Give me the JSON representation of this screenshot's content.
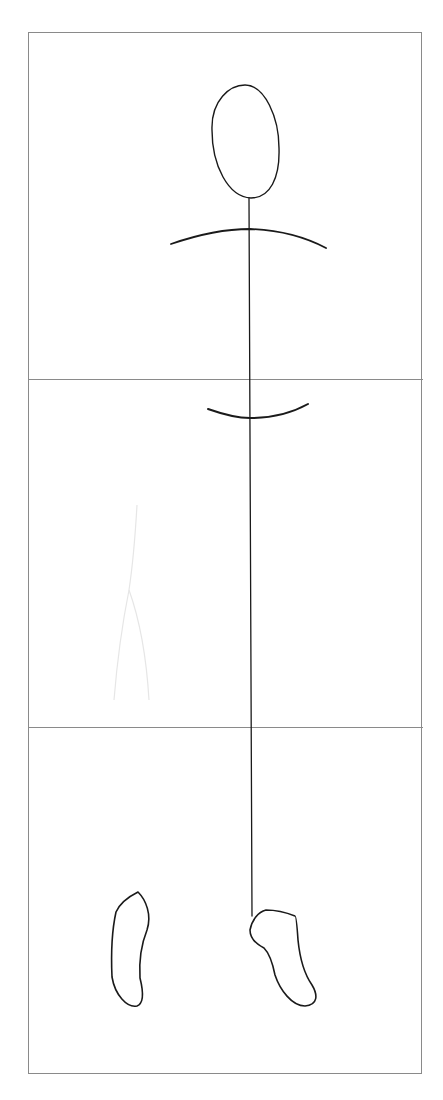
{
  "drawing": {
    "subject": "stick figure proportion sketch",
    "paper_color": "#ffffff",
    "frame_color": "#8a8a8a",
    "ink_color": "#1a1a1a",
    "ghost_color": "#e4e4e4",
    "sections": 3,
    "parts": [
      "head",
      "shoulders",
      "spine",
      "hips",
      "left-foot",
      "right-foot"
    ]
  }
}
